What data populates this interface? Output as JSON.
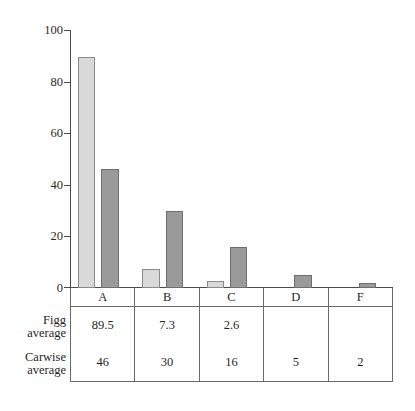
{
  "chart_data": {
    "type": "bar",
    "title": "",
    "xlabel": "",
    "ylabel": "",
    "ylim": [
      0,
      100
    ],
    "yticks": [
      0,
      20,
      40,
      60,
      80,
      100
    ],
    "grid": false,
    "legend": "none",
    "categories": [
      "A",
      "B",
      "C",
      "D",
      "F"
    ],
    "series": [
      {
        "name": "Figg average",
        "values": [
          89.5,
          7.3,
          2.6,
          null,
          null
        ]
      },
      {
        "name": "Carwise average",
        "values": [
          46,
          30,
          16,
          5,
          2
        ]
      }
    ],
    "colors": {
      "figg": "#d9d9d9",
      "carwise": "#9a9a9a",
      "axis": "#4a4a4a",
      "table_border": "#6a6a6a",
      "text": "#1f1f1f",
      "background": "#ffffff"
    }
  },
  "axis": {
    "tick_labels": [
      "100",
      "80",
      "60",
      "40",
      "20",
      "0"
    ]
  },
  "table": {
    "column_headers": [
      "A",
      "B",
      "C",
      "D",
      "F"
    ],
    "rows": [
      {
        "label_line1": "Figg",
        "label_line2": "average",
        "cells": [
          "89.5",
          "7.3",
          "2.6",
          "",
          ""
        ]
      },
      {
        "label_line1": "Carwise",
        "label_line2": "average",
        "cells": [
          "46",
          "30",
          "16",
          "5",
          "2"
        ]
      }
    ]
  }
}
